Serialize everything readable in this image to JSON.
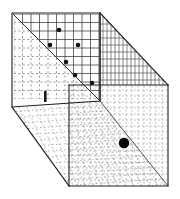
{
  "figure": {
    "style": "vintage line engraving",
    "background_color": "#ffffff",
    "line_color": "#1c1c1c",
    "canvas": {
      "width": 180,
      "height": 199
    }
  },
  "geometry": {
    "outer_outline_points": "12,13 100,13 168,85 168,186 69,186 12,107",
    "back_wall": {
      "x0": 14,
      "y0": 14,
      "x1": 99,
      "y1": 99,
      "rows": 10,
      "cols": 10
    },
    "back_wall_diagonal": "13,14 100,101",
    "top_right_panel": "100,13 168,85 100,85",
    "front_right_panel": {
      "x0": 69,
      "y0": 85,
      "x1": 167,
      "y1": 185
    },
    "floor_quad": "12,107 69,186 167,186 100,101",
    "left_vertical_edge": "12,13 12,107",
    "right_vertical_edge": "168,85 168,186",
    "inner_vertical_edge": "69,85 69,186",
    "inner_corner_edge": "100,13 100,101",
    "bottom_left_diagonal": "12,107 69,186",
    "floor_right_diagonal": "100,101 168,186"
  },
  "markers": {
    "back_wall_dots": [
      {
        "name": "dot-1",
        "cx": 59,
        "cy": 30,
        "r": 2.3
      },
      {
        "name": "dot-2",
        "cx": 50,
        "cy": 45,
        "r": 2.3
      },
      {
        "name": "dot-3",
        "cx": 78,
        "cy": 45,
        "r": 2.3
      },
      {
        "name": "dot-4",
        "cx": 66,
        "cy": 62,
        "r": 2.3
      },
      {
        "name": "dot-5",
        "cx": 75,
        "cy": 75,
        "r": 2.3
      },
      {
        "name": "dot-6",
        "cx": 92,
        "cy": 83,
        "r": 2.3
      }
    ],
    "floor_dot": {
      "name": "floor-dot",
      "cx": 124,
      "cy": 143,
      "r": 5.2
    },
    "wall_tick": {
      "name": "wall-tick-mark",
      "x": 44,
      "y": 91,
      "w": 2.6,
      "h": 11
    }
  },
  "colors": {
    "ink": "#1c1c1c",
    "grid": "#3a3a3a",
    "grid_faint": "#6e6e6e",
    "hatch": "#4a4a4a",
    "paper": "#ffffff"
  }
}
